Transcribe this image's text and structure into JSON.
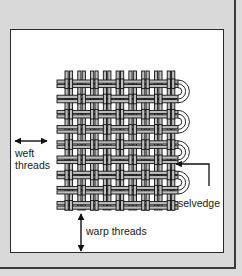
{
  "diagram": {
    "labels": {
      "weft": [
        "weft",
        "threads"
      ],
      "selvedge": "selvedge",
      "warp": "warp threads"
    },
    "colors": {
      "background": "#dcdcdc",
      "panel": "#ffffff",
      "thread_fill": "#bdbdbd",
      "thread_outline": "#111111",
      "text": "#1a1a1a"
    },
    "weave": {
      "type": "plain weave with paired threads",
      "warp_pairs": 9,
      "weft_pairs": 9
    }
  }
}
